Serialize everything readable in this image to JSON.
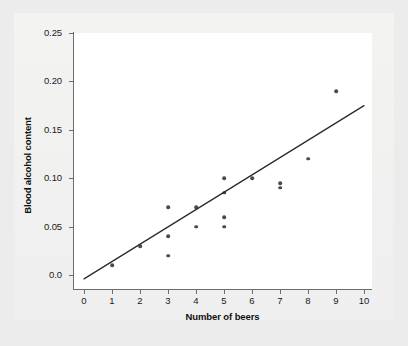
{
  "chart_data": {
    "type": "scatter",
    "title": "",
    "xlabel": "Number of beers",
    "ylabel": "Blood alcohol content",
    "xlim": [
      0,
      10
    ],
    "ylim": [
      0.0,
      0.25
    ],
    "grid": false,
    "legend": null,
    "x_ticks": [
      "0",
      "1",
      "2",
      "3",
      "4",
      "5",
      "6",
      "7",
      "8",
      "9",
      "10"
    ],
    "x_tick_values": [
      0,
      1,
      2,
      3,
      4,
      5,
      6,
      7,
      8,
      9,
      10
    ],
    "y_ticks": [
      "0.0",
      "0.05",
      "0.10",
      "0.15",
      "0.20",
      "0.25"
    ],
    "y_tick_values": [
      0.0,
      0.05,
      0.1,
      0.15,
      0.2,
      0.25
    ],
    "points": [
      {
        "x": 1,
        "y": 0.01
      },
      {
        "x": 2,
        "y": 0.03
      },
      {
        "x": 3,
        "y": 0.02
      },
      {
        "x": 3,
        "y": 0.04
      },
      {
        "x": 3,
        "y": 0.07
      },
      {
        "x": 4,
        "y": 0.05
      },
      {
        "x": 4,
        "y": 0.07
      },
      {
        "x": 5,
        "y": 0.05
      },
      {
        "x": 5,
        "y": 0.06
      },
      {
        "x": 5,
        "y": 0.085
      },
      {
        "x": 5,
        "y": 0.1
      },
      {
        "x": 6,
        "y": 0.1
      },
      {
        "x": 7,
        "y": 0.09
      },
      {
        "x": 7,
        "y": 0.095
      },
      {
        "x": 8,
        "y": 0.12
      },
      {
        "x": 9,
        "y": 0.19
      }
    ],
    "point_color": "#4a4a52",
    "trend_line": {
      "type": "linear-fit",
      "color": "#2a2a2a",
      "x_start": 0,
      "y_start": -0.004,
      "x_end": 10,
      "y_end": 0.175
    },
    "axis_color": "#6d6d6d",
    "plot_background": "#ffffff",
    "figure_background": "#f2f2f1"
  }
}
